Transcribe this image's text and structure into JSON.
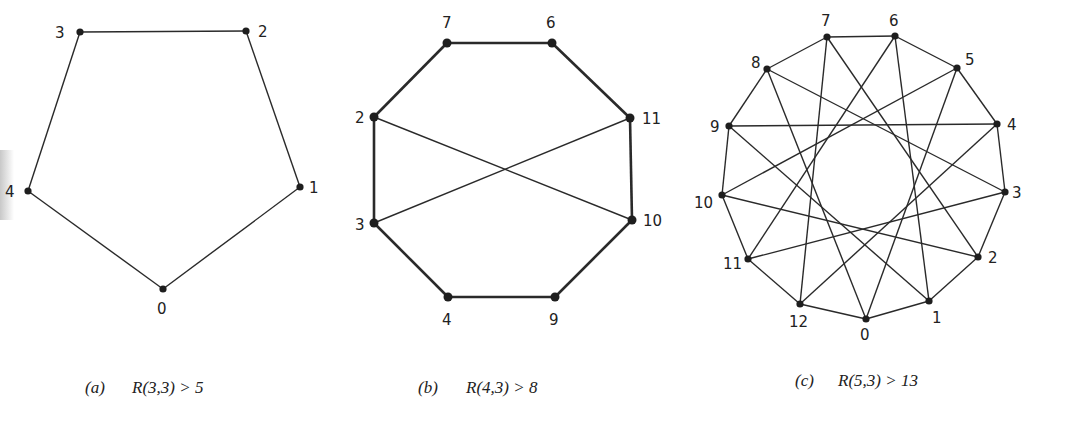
{
  "figures": [
    {
      "id": "a",
      "caption_tag": "(a)",
      "caption_text": "R(3,3) > 5",
      "vertices": [
        {
          "label": "0",
          "x": 163,
          "y": 289,
          "lx": 157,
          "ly": 314
        },
        {
          "label": "1",
          "x": 300,
          "y": 187,
          "lx": 309,
          "ly": 193
        },
        {
          "label": "2",
          "x": 246,
          "y": 31,
          "lx": 258,
          "ly": 37
        },
        {
          "label": "3",
          "x": 80,
          "y": 32,
          "lx": 55,
          "ly": 38
        },
        {
          "label": "4",
          "x": 28,
          "y": 191,
          "lx": 5,
          "ly": 197
        }
      ],
      "edges": [
        [
          0,
          1
        ],
        [
          1,
          2
        ],
        [
          2,
          3
        ],
        [
          3,
          4
        ],
        [
          4,
          0
        ]
      ],
      "thick_edges": []
    },
    {
      "id": "b",
      "caption_tag": "(b)",
      "caption_text": "R(4,3) > 8",
      "vertices": [
        {
          "label": "7",
          "x": 447,
          "y": 43,
          "lx": 442,
          "ly": 28
        },
        {
          "label": "6",
          "x": 552,
          "y": 43,
          "lx": 546,
          "ly": 28
        },
        {
          "label": "11",
          "x": 630,
          "y": 118,
          "lx": 642,
          "ly": 124
        },
        {
          "label": "10",
          "x": 632,
          "y": 220,
          "lx": 643,
          "ly": 226
        },
        {
          "label": "9",
          "x": 555,
          "y": 297,
          "lx": 549,
          "ly": 325
        },
        {
          "label": "4",
          "x": 448,
          "y": 297,
          "lx": 442,
          "ly": 325
        },
        {
          "label": "3",
          "x": 374,
          "y": 223,
          "lx": 355,
          "ly": 230
        },
        {
          "label": "2",
          "x": 374,
          "y": 117,
          "lx": 355,
          "ly": 123
        }
      ],
      "edges": [
        [
          0,
          1
        ],
        [
          1,
          2
        ],
        [
          2,
          3
        ],
        [
          3,
          4
        ],
        [
          4,
          5
        ],
        [
          5,
          6
        ],
        [
          6,
          7
        ],
        [
          7,
          0
        ],
        [
          7,
          3
        ],
        [
          6,
          2
        ]
      ],
      "thick_edges": [
        [
          0,
          1
        ],
        [
          1,
          2
        ],
        [
          2,
          3
        ],
        [
          3,
          4
        ],
        [
          4,
          5
        ],
        [
          5,
          6
        ],
        [
          6,
          7
        ],
        [
          7,
          0
        ]
      ]
    },
    {
      "id": "c",
      "caption_tag": "(c)",
      "caption_text": "R(5,3) > 13",
      "vertices": [
        {
          "label": "0",
          "x": 866,
          "y": 319,
          "lx": 860,
          "ly": 340
        },
        {
          "label": "1",
          "x": 929,
          "y": 301,
          "lx": 932,
          "ly": 323
        },
        {
          "label": "2",
          "x": 978,
          "y": 257,
          "lx": 988,
          "ly": 263
        },
        {
          "label": "3",
          "x": 1005,
          "y": 192,
          "lx": 1012,
          "ly": 198
        },
        {
          "label": "4",
          "x": 997,
          "y": 124,
          "lx": 1007,
          "ly": 130
        },
        {
          "label": "5",
          "x": 957,
          "y": 68,
          "lx": 965,
          "ly": 65
        },
        {
          "label": "6",
          "x": 895,
          "y": 36,
          "lx": 889,
          "ly": 26
        },
        {
          "label": "7",
          "x": 827,
          "y": 37,
          "lx": 821,
          "ly": 26
        },
        {
          "label": "8",
          "x": 767,
          "y": 69,
          "lx": 751,
          "ly": 68
        },
        {
          "label": "9",
          "x": 729,
          "y": 126,
          "lx": 710,
          "ly": 132
        },
        {
          "label": "10",
          "x": 722,
          "y": 195,
          "lx": 694,
          "ly": 208
        },
        {
          "label": "11",
          "x": 748,
          "y": 259,
          "lx": 723,
          "ly": 269
        },
        {
          "label": "12",
          "x": 800,
          "y": 304,
          "lx": 789,
          "ly": 327
        }
      ],
      "edge_offsets": [
        1,
        5
      ],
      "edges": []
    }
  ]
}
